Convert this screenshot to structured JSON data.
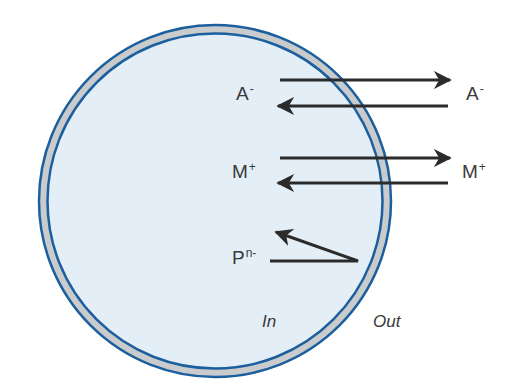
{
  "diagram": {
    "colors": {
      "cytoplasm": "#e4eef6",
      "membrane_fill": "#c9cbcc",
      "membrane_stroke": "#1b5f9e",
      "arrow": "#2b2b2b",
      "text": "#3a3a3a"
    },
    "ions": [
      {
        "id": "anion",
        "symbol": "A",
        "charge": "-",
        "inside": true,
        "outside": true,
        "direction": "bidirectional"
      },
      {
        "id": "cation",
        "symbol": "M",
        "charge": "+",
        "inside": true,
        "outside": true,
        "direction": "bidirectional"
      },
      {
        "id": "protein",
        "symbol": "P",
        "charge": "n-",
        "inside": true,
        "outside": false,
        "direction": "reflected"
      }
    ],
    "regions": {
      "inside_label": "In",
      "outside_label": "Out"
    }
  }
}
